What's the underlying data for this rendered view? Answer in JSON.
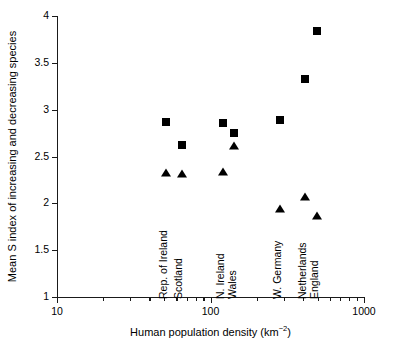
{
  "chart_data": {
    "type": "scatter",
    "title": "",
    "xlabel": "Human population density (km−2)",
    "ylabel": "Mean S index of increasing and decreasing species",
    "xscale": "log",
    "xlim": [
      10,
      1000
    ],
    "ylim": [
      1,
      4
    ],
    "x_tick_labels": [
      "10",
      "100",
      "1000"
    ],
    "x_tick_values": [
      10,
      100,
      1000
    ],
    "y_tick_labels": [
      "1",
      "1.5",
      "2",
      "2.5",
      "3",
      "3.5",
      "4"
    ],
    "y_tick_values": [
      1,
      1.5,
      2,
      2.5,
      3,
      3.5,
      4
    ],
    "grid": false,
    "legend": "none",
    "categories": [
      "Rep. of Ireland",
      "Scotland",
      "N. Ireland",
      "Wales",
      "W. Germany",
      "Netherlands",
      "England"
    ],
    "x": [
      50,
      64,
      110,
      128,
      228,
      297,
      360
    ],
    "series": [
      {
        "name": "squares",
        "marker": "square",
        "values": [
          2.83,
          2.63,
          2.85,
          2.77,
          2.89,
          3.34,
          3.85
        ]
      },
      {
        "name": "triangles",
        "marker": "triangle",
        "values": [
          2.32,
          2.31,
          2.34,
          2.64,
          1.95,
          2.08,
          1.87
        ]
      }
    ],
    "points": [
      {
        "label": "Rep. of Ireland",
        "x": 50,
        "px": 166,
        "square_y": 2.83,
        "square_py": 122,
        "triangle_y": 2.32,
        "triangle_py": 173
      },
      {
        "label": "Scotland",
        "x": 64,
        "px": 182,
        "square_y": 2.63,
        "square_py": 145,
        "triangle_y": 2.31,
        "triangle_py": 174
      },
      {
        "label": "N. Ireland",
        "x": 110,
        "px": 223,
        "square_y": 2.85,
        "square_py": 123,
        "triangle_y": 2.34,
        "triangle_py": 172
      },
      {
        "label": "Wales",
        "x": 128,
        "px": 234,
        "square_y": 2.77,
        "square_py": 133,
        "triangle_y": 2.64,
        "triangle_py": 146
      },
      {
        "label": "W. Germany",
        "x": 228,
        "px": 280,
        "square_y": 2.89,
        "square_py": 120,
        "triangle_y": 1.95,
        "triangle_py": 209
      },
      {
        "label": "Netherlands",
        "x": 297,
        "px": 305,
        "square_y": 3.34,
        "square_py": 79,
        "triangle_y": 2.08,
        "triangle_py": 197
      },
      {
        "label": "England",
        "x": 360,
        "px": 317,
        "square_y": 3.85,
        "square_py": 31,
        "triangle_y": 1.87,
        "triangle_py": 216
      }
    ],
    "point_labels": [
      {
        "text": "Rep. of Ireland",
        "px": 169,
        "baseline_py": 288
      },
      {
        "text": "Scotland",
        "px": 184,
        "baseline_py": 288
      },
      {
        "text": "N. Ireland",
        "px": 226,
        "baseline_py": 288
      },
      {
        "text": "Wales",
        "px": 238,
        "baseline_py": 288
      },
      {
        "text": "W. Germany",
        "px": 283,
        "baseline_py": 288
      },
      {
        "text": "Netherlands",
        "px": 308,
        "baseline_py": 288
      },
      {
        "text": "England",
        "px": 320,
        "baseline_py": 288
      }
    ]
  },
  "axes": {
    "y_title": "Mean S index of increasing and decreasing species",
    "x_title_main": "Human population density (km",
    "x_title_sup": "−2",
    "x_title_tail": ")",
    "y_ticks": [
      {
        "label": "4",
        "value": 4,
        "py": 16
      },
      {
        "label": "3.5",
        "value": 3.5,
        "py": 62.8
      },
      {
        "label": "3",
        "value": 3,
        "py": 109.7
      },
      {
        "label": "2.5",
        "value": 2.5,
        "py": 156.5
      },
      {
        "label": "2",
        "value": 2,
        "py": 203.3
      },
      {
        "label": "1.5",
        "value": 1.5,
        "py": 250.2
      },
      {
        "label": "1",
        "value": 1,
        "py": 297
      }
    ],
    "x_major_ticks": [
      {
        "label": "10",
        "value": 10,
        "px": 57
      },
      {
        "label": "100",
        "value": 100,
        "px": 210.5
      },
      {
        "label": "1000",
        "value": 1000,
        "px": 364
      }
    ],
    "x_minor_ticks": [
      {
        "value": 20,
        "px": 103.2
      },
      {
        "value": 30,
        "px": 130.2
      },
      {
        "value": 40,
        "px": 149.4
      },
      {
        "value": 50,
        "px": 164.3
      },
      {
        "value": 60,
        "px": 176.4
      },
      {
        "value": 70,
        "px": 186.7
      },
      {
        "value": 80,
        "px": 195.6
      },
      {
        "value": 90,
        "px": 203.4
      },
      {
        "value": 200,
        "px": 256.7
      },
      {
        "value": 300,
        "px": 283.7
      },
      {
        "value": 400,
        "px": 302.9
      },
      {
        "value": 500,
        "px": 317.8
      },
      {
        "value": 600,
        "px": 329.9
      },
      {
        "value": 700,
        "px": 340.2
      },
      {
        "value": 800,
        "px": 349.1
      },
      {
        "value": 900,
        "px": 356.9
      }
    ]
  },
  "colors": {
    "marker": "#000000",
    "axis": "#1a1a1a",
    "text": "#000000",
    "background": "#ffffff"
  }
}
